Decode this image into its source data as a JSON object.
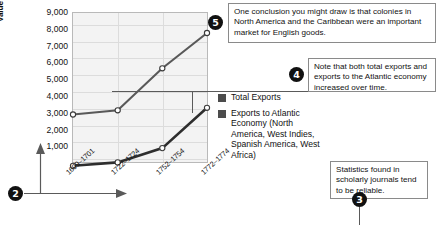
{
  "chart_data": {
    "type": "line",
    "title": "",
    "xlabel": "",
    "ylabel": "Value (Thousands of Pounds Sterling)",
    "categories": [
      "1699–1701",
      "1722–1724",
      "1752–1754",
      "1772–1774"
    ],
    "ylim": [
      0,
      9000
    ],
    "yticks": [
      "1,000",
      "2,000",
      "3,000",
      "4,000",
      "5,000",
      "6,000",
      "7,000",
      "8,000",
      "9,000"
    ],
    "ytick_values": [
      1000,
      2000,
      3000,
      4000,
      5000,
      6000,
      7000,
      8000,
      9000
    ],
    "grid": true,
    "legend_position": "right",
    "series": [
      {
        "name": "Total Exports",
        "color": "#4c4c4c",
        "values": [
          3600,
          3850,
          6350,
          8450
        ]
      },
      {
        "name": "Exports to Atlantic Economy (North America, West Indies, Spanish America, West Africa)",
        "color": "#333333",
        "values": [
          550,
          750,
          1600,
          4000
        ]
      }
    ]
  },
  "legend": {
    "items": [
      {
        "label": "Total Exports",
        "color": "#4c4c4c"
      },
      {
        "label": "Exports to Atlantic Economy (North America, West Indies, Spanish America, West Africa)",
        "color": "#333333"
      }
    ]
  },
  "annotations": [
    {
      "number": "2",
      "text": ""
    },
    {
      "number": "3",
      "text": "Statistics found in scholarly journals tend to be reliable."
    },
    {
      "number": "4",
      "text": "Note that both total exports and exports to the Atlantic economy increased over time."
    },
    {
      "number": "5",
      "text": "One conclusion you might draw is that colonies in North America and the Caribbean were an important market for English goods."
    }
  ]
}
